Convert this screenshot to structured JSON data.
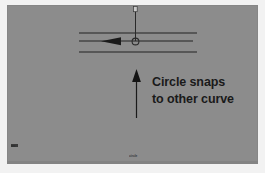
{
  "figure": {
    "width": 265,
    "height": 173,
    "background_color": "#ffffff",
    "viewport_color": "#8c8c8c",
    "ink_color": "#1f1f1f"
  },
  "annotation": {
    "line1": "Circle snaps",
    "line2": "to other curve",
    "color": "#1a1a1a"
  },
  "captions": {
    "bottom_center": "circle",
    "bottom_left": "arc"
  },
  "geometry": {
    "curves": [
      {
        "name": "upper-curve",
        "x1": 72,
        "y1": 28,
        "x2": 190,
        "y2": 28
      },
      {
        "name": "middle-curve",
        "x1": 72,
        "y1": 36,
        "x2": 186,
        "y2": 36
      },
      {
        "name": "lower-curve",
        "x1": 72,
        "y1": 47,
        "x2": 190,
        "y2": 47
      }
    ],
    "direction_arrow": {
      "name": "curve-direction-arrow",
      "x": 106,
      "y": 36,
      "points": "left"
    },
    "snap_marker": {
      "name": "circle-snap-marker",
      "cx": 128,
      "cy": 36,
      "r": 3.4
    },
    "leader_vertical": {
      "name": "circle-radius-leader",
      "x": 128,
      "y_top": 2,
      "y_bottom": 36
    },
    "callout_arrow": {
      "name": "callout-arrow",
      "x": 129,
      "y_tip": 66,
      "y_tail": 113,
      "points": "up"
    }
  }
}
